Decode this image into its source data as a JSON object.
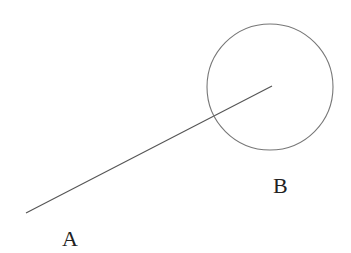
{
  "diagram": {
    "stroke_color": "#555555",
    "label_color": "#222222",
    "segment": {
      "x1": 26,
      "y1": 213,
      "x2": 272,
      "y2": 86
    },
    "circle": {
      "cx": 270,
      "cy": 87,
      "r": 63
    },
    "labels": {
      "a": {
        "text": "A",
        "x": 62,
        "y": 246
      },
      "b": {
        "text": "B",
        "x": 273,
        "y": 193
      }
    }
  }
}
